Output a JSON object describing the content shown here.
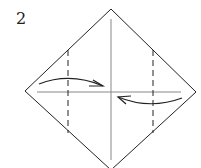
{
  "diagram": {
    "step_number": "2",
    "colors": {
      "outline": "#222222",
      "crease": "#888888",
      "background": "#ffffff"
    },
    "elements": [
      {
        "type": "square-diamond",
        "label": "paper outline"
      },
      {
        "type": "crease-vertical",
        "label": "center vertical crease"
      },
      {
        "type": "crease-horizontal",
        "label": "center horizontal crease"
      },
      {
        "type": "valley-fold-line",
        "label": "left dashed fold line"
      },
      {
        "type": "valley-fold-line",
        "label": "right dashed fold line"
      },
      {
        "type": "arrow",
        "label": "fold left corner to center"
      },
      {
        "type": "arrow",
        "label": "fold right corner to center"
      }
    ]
  }
}
